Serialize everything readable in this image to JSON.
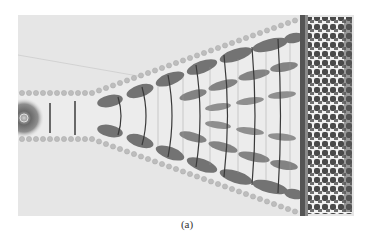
{
  "figure": {
    "caption": "(a)",
    "colors": {
      "background": "#e6e6e6",
      "dots": "#b8b8b8",
      "field_dark": "#5a5a5a",
      "lines": "#3c3c3c",
      "right_structure": "#4a4a4a"
    }
  }
}
